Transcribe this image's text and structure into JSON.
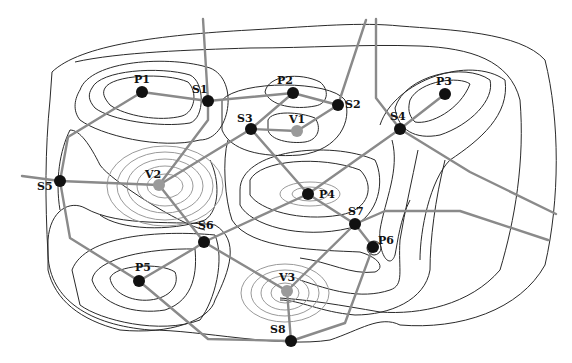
{
  "diagram": {
    "type": "contour-critical-point-graph",
    "colors": {
      "background": "#ffffff",
      "contour_dark": "#2a2a2a",
      "contour_light": "#9a9a9a",
      "edge": "#8a8a8a",
      "peak_saddle_node": "#111111",
      "valley_node": "#9a9a9a",
      "label": "#111111"
    },
    "nodes": [
      {
        "id": "P1",
        "kind": "peak",
        "x": 142,
        "y": 92,
        "label": "P1",
        "lx": 134,
        "ly": 83
      },
      {
        "id": "P2",
        "kind": "peak",
        "x": 293,
        "y": 93,
        "label": "P2",
        "lx": 277,
        "ly": 84
      },
      {
        "id": "P3",
        "kind": "peak",
        "x": 445,
        "y": 94,
        "label": "P3",
        "lx": 436,
        "ly": 85
      },
      {
        "id": "P4",
        "kind": "peak",
        "x": 308,
        "y": 194,
        "label": "P4",
        "lx": 319,
        "ly": 198
      },
      {
        "id": "P5",
        "kind": "peak",
        "x": 139,
        "y": 281,
        "label": "P5",
        "lx": 135,
        "ly": 271
      },
      {
        "id": "P6",
        "kind": "peak",
        "x": 373,
        "y": 247,
        "label": "P6",
        "lx": 378,
        "ly": 244
      },
      {
        "id": "V1",
        "kind": "valley",
        "x": 297,
        "y": 131,
        "label": "V1",
        "lx": 289,
        "ly": 123
      },
      {
        "id": "V2",
        "kind": "valley",
        "x": 159,
        "y": 185,
        "label": "V2",
        "lx": 145,
        "ly": 178
      },
      {
        "id": "V3",
        "kind": "valley",
        "x": 287,
        "y": 291,
        "label": "V3",
        "lx": 279,
        "ly": 281
      },
      {
        "id": "S1",
        "kind": "saddle",
        "x": 208,
        "y": 101,
        "label": "S1",
        "lx": 192,
        "ly": 93
      },
      {
        "id": "S2",
        "kind": "saddle",
        "x": 338,
        "y": 105,
        "label": "S2",
        "lx": 345,
        "ly": 108
      },
      {
        "id": "S3",
        "kind": "saddle",
        "x": 251,
        "y": 129,
        "label": "S3",
        "lx": 237,
        "ly": 122
      },
      {
        "id": "S4",
        "kind": "saddle",
        "x": 400,
        "y": 129,
        "label": "S4",
        "lx": 390,
        "ly": 120
      },
      {
        "id": "S5",
        "kind": "saddle",
        "x": 60,
        "y": 181,
        "label": "S5",
        "lx": 37,
        "ly": 190
      },
      {
        "id": "S6",
        "kind": "saddle",
        "x": 204,
        "y": 242,
        "label": "S6",
        "lx": 198,
        "ly": 229
      },
      {
        "id": "S7",
        "kind": "saddle",
        "x": 355,
        "y": 224,
        "label": "S7",
        "lx": 348,
        "ly": 215
      },
      {
        "id": "S8",
        "kind": "saddle",
        "x": 291,
        "y": 341,
        "label": "S8",
        "lx": 270,
        "ly": 333
      }
    ],
    "edges": [
      {
        "from": "P1",
        "to": "S1",
        "points": "142,92 208,101"
      },
      {
        "from": "S1",
        "to": "P2",
        "points": "208,101 293,93"
      },
      {
        "from": "P2",
        "to": "S2",
        "points": "293,93 338,105"
      },
      {
        "from": "S2",
        "to": "V1",
        "points": "338,105 297,131"
      },
      {
        "from": "S3",
        "to": "V1",
        "points": "251,129 297,131"
      },
      {
        "from": "P2",
        "to": "S3",
        "points": "293,93 251,129"
      },
      {
        "from": "S3",
        "to": "V2",
        "points": "251,129 159,185"
      },
      {
        "from": "S1",
        "to": "V2",
        "points": "208,101 208,120 159,185"
      },
      {
        "from": "P1",
        "to": "S5",
        "points": "142,92 68,137 60,181"
      },
      {
        "from": "S5",
        "to": "V2",
        "points": "60,181 159,185"
      },
      {
        "from": "V2",
        "to": "S6",
        "points": "159,185 204,242"
      },
      {
        "from": "S5",
        "to": "P5",
        "points": "60,181 70,238 139,281"
      },
      {
        "from": "P5",
        "to": "S6",
        "points": "139,281 195,248 204,242"
      },
      {
        "from": "S6",
        "to": "P4",
        "points": "204,242 308,194"
      },
      {
        "from": "S6",
        "to": "V3",
        "points": "204,242 287,291"
      },
      {
        "from": "S3",
        "to": "P4",
        "points": "251,129 308,194"
      },
      {
        "from": "P4",
        "to": "S7",
        "points": "308,194 355,224"
      },
      {
        "from": "P4",
        "to": "S4",
        "points": "308,194 400,129"
      },
      {
        "from": "S4",
        "to": "P3",
        "points": "400,129 445,94"
      },
      {
        "from": "S7",
        "to": "P6",
        "points": "355,224 373,247"
      },
      {
        "from": "S7",
        "to": "V3",
        "points": "355,224 287,291"
      },
      {
        "from": "V3",
        "to": "S8",
        "points": "287,291 291,341"
      },
      {
        "from": "P5",
        "to": "S8",
        "points": "139,281 208,339 291,341"
      },
      {
        "from": "P6",
        "to": "S8",
        "points": "373,247 345,323 291,341"
      },
      {
        "from": "S1",
        "to": "top",
        "points": "208,101 203,19"
      },
      {
        "from": "S2",
        "to": "top",
        "points": "338,105 366,20"
      },
      {
        "from": "S4",
        "to": "top",
        "points": "400,129 376,98 376,19"
      },
      {
        "from": "S4",
        "to": "right",
        "points": "400,129 470,172 556,214"
      },
      {
        "from": "S7",
        "to": "right",
        "points": "355,224 385,211 460,211 548,240"
      },
      {
        "from": "S5",
        "to": "left",
        "points": "60,181 22,176"
      }
    ]
  }
}
